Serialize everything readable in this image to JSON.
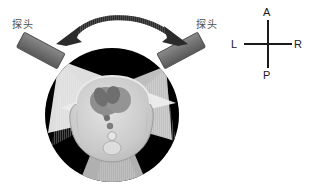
{
  "figure": {
    "type": "medical-illustration"
  },
  "probes": {
    "left": {
      "label": "探头",
      "icon": "ultrasound-probe-icon",
      "color": "#6e6e6e"
    },
    "right": {
      "label": "探头",
      "icon": "ultrasound-probe-icon",
      "color": "#6e6e6e"
    }
  },
  "sweep_arrow": {
    "name": "double-headed-arc-arrow",
    "color": "#3a3a3a",
    "direction": "bidirectional"
  },
  "scan_sectors": [
    {
      "name": "sector-left",
      "origin_deg": 215,
      "color": "#f2f2f2"
    },
    {
      "name": "sector-right",
      "origin_deg": 325,
      "color": "#f2f2f2"
    },
    {
      "name": "sector-bottom",
      "origin_deg": 90,
      "color": "#d8d8d8"
    }
  ],
  "anatomy": {
    "name": "thorax-cross-section",
    "background": "#000000",
    "body_fill": "#cfcfcf",
    "heart_fill": "#8a8a8a"
  },
  "orientation_compass": {
    "name": "anatomical-orientation-compass",
    "anterior": "A",
    "posterior": "P",
    "left": "L",
    "right": "R",
    "stroke": "#1a1a1a"
  },
  "colors": {
    "background": "#ffffff",
    "ink": "#1a1a1a",
    "label_gray": "#4d4d4d",
    "probe_gray": "#6e6e6e"
  }
}
